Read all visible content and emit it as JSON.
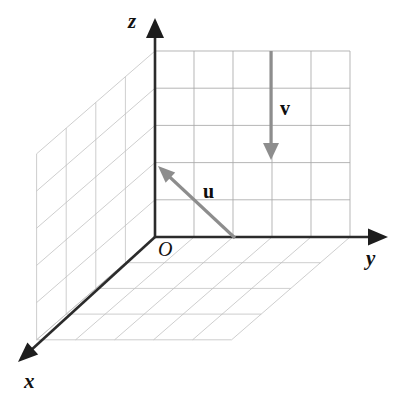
{
  "figure": {
    "background_color": "#ffffff"
  },
  "axes": {
    "x": {
      "label": "x",
      "arrow": "arrowhead-down-left",
      "color": "#2b2b2b"
    },
    "y": {
      "label": "y",
      "arrow": "arrowhead-right",
      "color": "#2b2b2b"
    },
    "z": {
      "label": "z",
      "arrow": "arrowhead-up",
      "color": "#2b2b2b"
    },
    "origin": {
      "label": "O",
      "color": "#111111"
    }
  },
  "planes": {
    "yz_wall": {
      "name": "yz-plane-grid",
      "columns": 5,
      "rows": 5,
      "color": "#a9a9a9"
    },
    "xz_wall": {
      "name": "xz-plane-grid",
      "columns": 4,
      "rows": 5,
      "color": "#bdbdbd"
    },
    "xy_floor": {
      "name": "xy-plane-grid",
      "columns": 5,
      "rows": 4,
      "color": "#bdbdbd"
    }
  },
  "vectors": [
    {
      "name": "u",
      "label": "u",
      "color": "#8d8d8d",
      "tail": {
        "x": 235,
        "y": 238
      },
      "tip": {
        "x": 158,
        "y": 166
      },
      "label_pos": {
        "x": 203,
        "y": 198
      },
      "description": "vector u pointing up and to the left from the floor toward the yz wall"
    },
    {
      "name": "v",
      "label": "v",
      "color": "#8d8d8d",
      "tail": {
        "x": 271,
        "y": 51
      },
      "tip": {
        "x": 271,
        "y": 160
      },
      "label_pos": {
        "x": 280,
        "y": 115
      },
      "description": "vector v pointing straight down in the yz wall"
    }
  ],
  "geometry": {
    "origin_px": {
      "x": 155,
      "y": 237
    },
    "z_tip_px": {
      "x": 155,
      "y": 18
    },
    "y_tip_px": {
      "x": 388,
      "y": 237
    },
    "x_tip_px": {
      "x": 18,
      "y": 362
    },
    "wall_top_px": {
      "x": 155,
      "y": 51
    },
    "wall_right_px": {
      "x": 350,
      "y": 237
    },
    "x_step_px": {
      "dx": -29.6,
      "dy": 25.7
    },
    "y_cell_px": 39.0,
    "z_cell_px": 37.2
  },
  "labels": {
    "x_pos": {
      "x": 24,
      "y": 388
    },
    "y_pos": {
      "x": 366,
      "y": 265
    },
    "z_pos": {
      "x": 128,
      "y": 28
    },
    "o_pos": {
      "x": 158,
      "y": 256
    }
  }
}
